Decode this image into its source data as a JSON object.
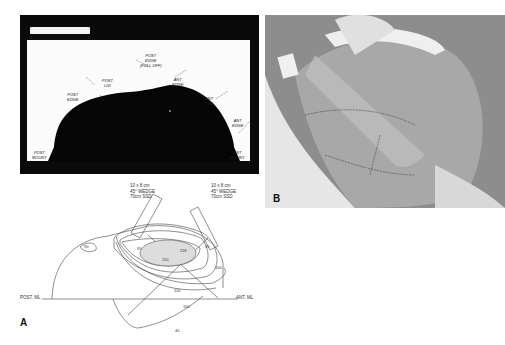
{
  "figure": {
    "panel_a": {
      "letter": "A",
      "photo_labels": {
        "post_edge_full_off": "POST\nEDGE\n(FULL OFF)",
        "post_lid": "POST\nLID",
        "post_edge": "POST\nEDGE",
        "ant_edge": "ANT\nEDGE",
        "ant_ssd": "ANT\nSSD",
        "ant_edge_2": "ANT\nEDGE",
        "post_mount": "POST\nMOUNT",
        "ant_mount": "ANT\nMOUNT"
      },
      "diagram": {
        "beam_left": "10 x 8 cm\n45° WEDGE\n70cm SSD",
        "beam_right": "10 x 8 cm\n45° WEDGE\n70cm SSD",
        "post_ml": "POST. ML",
        "ant_ml": "ANT. ML",
        "isodose_labels": [
          "90",
          "95",
          "110",
          "118",
          "95",
          "100",
          "110",
          "100",
          "40"
        ]
      }
    },
    "panel_b": {
      "letter": "B"
    }
  }
}
